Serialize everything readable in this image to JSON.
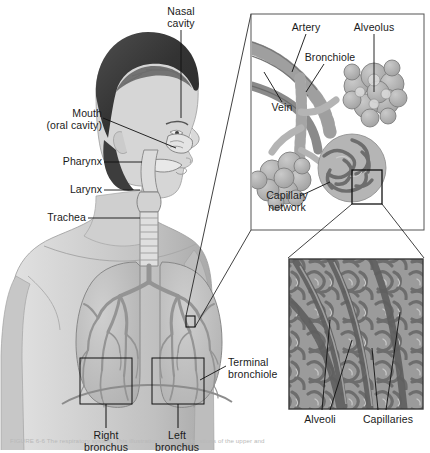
{
  "figure": {
    "caption": "FIGURE 6-6  The respiratory system. This illustration shows the locations of the upper and",
    "background": "#ffffff",
    "ink": "#1a1a1a"
  },
  "palette": {
    "skin_light": "#d8d8d8",
    "skin_mid": "#c4c4c4",
    "skin_shadow": "#ababab",
    "hair_dark": "#3a3a3a",
    "hair_mid": "#565656",
    "lung_fill": "#bdbdbd",
    "lung_edge": "#8d8d8d",
    "tree": "#9a9a9a",
    "artery": "#8a8a8a",
    "vein": "#6e6e6e",
    "alveolus": "#b2b2b2",
    "micrograph_bg": "#8f8f8f",
    "micrograph_vessel": "#6a6a6a",
    "frame": "#4a4a4a",
    "leader": "#000000"
  },
  "body_diagram": {
    "name": "human-torso-respiratory-anatomy",
    "view": "anterior torso with left-facing head profile",
    "labels": [
      {
        "id": "nasal-cavity",
        "text": "Nasal\ncavity",
        "x": 152,
        "y": 6,
        "w": 58,
        "align": "center"
      },
      {
        "id": "mouth",
        "text": "Mouth\n(oral cavity)",
        "x": 16,
        "y": 108,
        "w": 86,
        "align": "right"
      },
      {
        "id": "pharynx",
        "text": "Pharynx",
        "x": 32,
        "y": 158,
        "w": 70,
        "align": "right"
      },
      {
        "id": "larynx",
        "text": "Larynx",
        "x": 38,
        "y": 186,
        "w": 64,
        "align": "right"
      },
      {
        "id": "trachea",
        "text": "Trachea",
        "x": 22,
        "y": 214,
        "w": 64,
        "align": "right"
      },
      {
        "id": "right-bronchus",
        "text": "Right\nbronchus",
        "x": 46,
        "y": 410,
        "w": 68,
        "align": "center"
      },
      {
        "id": "left-bronchus",
        "text": "Left\nbronchus",
        "x": 130,
        "y": 410,
        "w": 66,
        "align": "center"
      },
      {
        "id": "terminal-bronchiole",
        "text": "Terminal\nbronchiole",
        "x": 228,
        "y": 357,
        "w": 72,
        "align": "left"
      }
    ]
  },
  "inset_top": {
    "name": "bronchiole-alveolus-inset",
    "frame": {
      "x": 251,
      "y": 14,
      "w": 173,
      "h": 216
    },
    "labels": [
      {
        "id": "artery",
        "text": "Artery",
        "x": 290,
        "y": 22,
        "w": 46,
        "align": "center"
      },
      {
        "id": "alveolus",
        "text": "Alveolus",
        "x": 364,
        "y": 22,
        "w": 56,
        "align": "center"
      },
      {
        "id": "bronchiole",
        "text": "Bronchiole",
        "x": 313,
        "y": 50,
        "w": 66,
        "align": "center"
      },
      {
        "id": "vein",
        "text": "Vein",
        "x": 264,
        "y": 106,
        "w": 36,
        "align": "center"
      },
      {
        "id": "capillary-network",
        "text": "Capillary\nnetwork",
        "x": 258,
        "y": 191,
        "w": 62,
        "align": "center"
      }
    ]
  },
  "inset_bottom": {
    "name": "capillary-micrograph-inset",
    "frame": {
      "x": 288,
      "y": 258,
      "w": 136,
      "h": 152
    },
    "labels": [
      {
        "id": "alveoli",
        "text": "Alveoli",
        "x": 302,
        "y": 414,
        "w": 56,
        "align": "center"
      },
      {
        "id": "capillaries",
        "text": "Capillaries",
        "x": 358,
        "y": 414,
        "w": 66,
        "align": "center"
      }
    ]
  },
  "callouts": [
    {
      "id": "chest-to-top-inset",
      "from": "left lung detail box",
      "to": "top inset"
    },
    {
      "id": "top-inset-to-micrograph",
      "from": "capillary bed box",
      "to": "bottom micrograph"
    }
  ]
}
